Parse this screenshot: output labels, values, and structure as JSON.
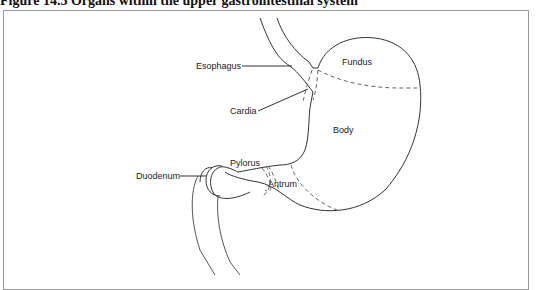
{
  "figure": {
    "title": "Figure 14.5   Organs within the upper gastrointestinal system"
  },
  "labels": {
    "esophagus": "Esophagus",
    "fundus": "Fundus",
    "cardia": "Cardia",
    "body": "Body",
    "pylorus": "Pylorus",
    "antrum": "Antrum",
    "duodenum": "Duodenum"
  },
  "colors": {
    "line": "#333333",
    "dashed": "#666666",
    "frame": "#9a9a9a"
  }
}
